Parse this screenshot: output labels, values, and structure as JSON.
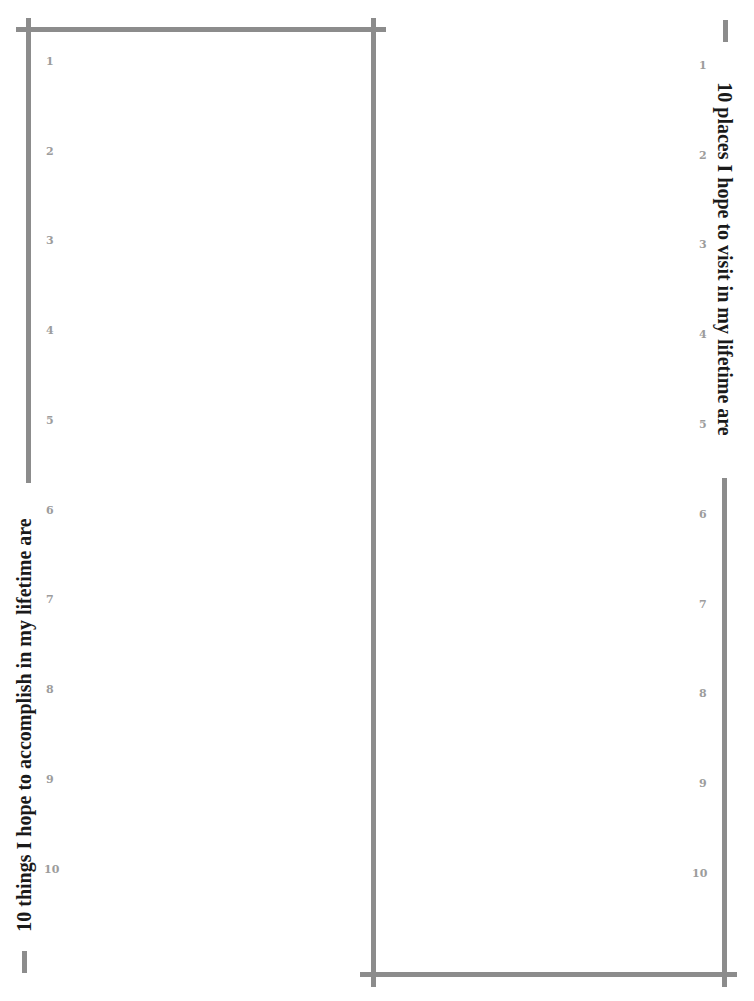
{
  "left_panel": {
    "title": "10 things I hope to accomplish in my lifetime are",
    "numbers": [
      "1",
      "2",
      "3",
      "4",
      "5",
      "6",
      "7",
      "8",
      "9",
      "10"
    ]
  },
  "right_panel": {
    "title": "10 places I hope to visit in my lifetime are",
    "numbers": [
      "1",
      "2",
      "3",
      "4",
      "5",
      "6",
      "7",
      "8",
      "9",
      "10"
    ]
  },
  "colors": {
    "frame": "#8c8c8c",
    "numbers": "#9c9c9c",
    "title": "#1a1a1a"
  }
}
